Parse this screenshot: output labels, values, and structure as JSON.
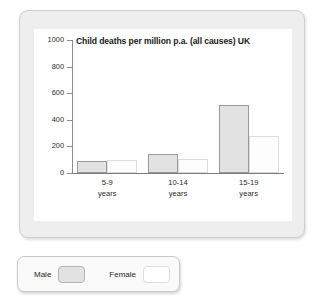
{
  "chart_data": {
    "type": "bar",
    "title": "Child deaths per million p.a. (all causes) UK",
    "xlabel": "",
    "ylabel": "",
    "ylim": [
      0,
      1000
    ],
    "yticks": [
      0,
      200,
      400,
      600,
      800,
      1000
    ],
    "ytick_labels": [
      "0",
      "200",
      "400",
      "600",
      "800",
      "1000"
    ],
    "grid": false,
    "legend_position": "below-outside",
    "categories": [
      "5-9 years",
      "10-14 years",
      "15-19 years"
    ],
    "category_lines": [
      {
        "line1": "5-9",
        "line2": "years"
      },
      {
        "line1": "10-14",
        "line2": "years"
      },
      {
        "line1": "15-19",
        "line2": "years"
      }
    ],
    "series": [
      {
        "name": "Male",
        "color": "#e2e2e2",
        "border": "#9a9a9a",
        "values": [
          90,
          140,
          510
        ]
      },
      {
        "name": "Female",
        "color": "#ffffff",
        "border": "#dcdcdc",
        "values": [
          100,
          105,
          280
        ]
      }
    ]
  },
  "legend": {
    "male_label": "Male",
    "female_label": "Female"
  },
  "colors": {
    "frame_bg": "#eeeeee",
    "plot_bg": "#ffffff",
    "axis": "#8c8c8c",
    "male": "#e2e2e2",
    "female": "#ffffff"
  }
}
